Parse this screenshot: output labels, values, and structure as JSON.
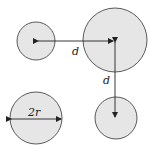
{
  "diagram": {
    "title": "",
    "colors": {
      "fill": "#e6e6e6",
      "stroke": "#333333",
      "arrow": "#222222"
    },
    "circles": [
      {
        "id": "top-left",
        "cx": 36,
        "cy": 41,
        "r": 19
      },
      {
        "id": "top-right-large",
        "cx": 115,
        "cy": 40,
        "r": 32
      },
      {
        "id": "bottom-right",
        "cx": 116,
        "cy": 118,
        "r": 21
      },
      {
        "id": "bottom-left",
        "cx": 36,
        "cy": 118,
        "r": 26
      }
    ],
    "labels": {
      "horizontal_distance": "d",
      "vertical_distance": "d",
      "diameter": "2r"
    }
  }
}
